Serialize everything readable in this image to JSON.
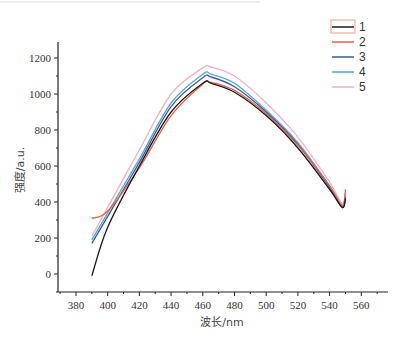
{
  "chart_data": {
    "type": "line",
    "title": "",
    "xlabel": "波长/nm",
    "ylabel": "强度/a.u.",
    "xlim": [
      370,
      570
    ],
    "ylim": [
      -120,
      1300
    ],
    "x_ticks": [
      380,
      400,
      420,
      440,
      460,
      480,
      500,
      520,
      540,
      560
    ],
    "y_ticks": [
      0,
      200,
      400,
      600,
      800,
      1000,
      1200
    ],
    "grid": false,
    "legend_position": "top-right",
    "x": [
      390,
      400,
      420,
      440,
      460,
      465,
      480,
      500,
      520,
      540,
      548,
      550
    ],
    "series": [
      {
        "name": "1",
        "color": "#1a1a1a",
        "values": [
          -10,
          260,
          600,
          900,
          1060,
          1060,
          1010,
          880,
          700,
          470,
          370,
          420
        ]
      },
      {
        "name": "2",
        "color": "#e8604c",
        "values": [
          310,
          350,
          590,
          880,
          1055,
          1065,
          1020,
          890,
          715,
          490,
          380,
          470
        ]
      },
      {
        "name": "3",
        "color": "#3b5a9a",
        "values": [
          170,
          320,
          620,
          930,
          1090,
          1095,
          1040,
          900,
          720,
          480,
          370,
          430
        ]
      },
      {
        "name": "4",
        "color": "#5aa6cf",
        "values": [
          190,
          340,
          640,
          950,
          1110,
          1110,
          1060,
          910,
          730,
          490,
          380,
          440
        ]
      },
      {
        "name": "5",
        "color": "#f1b2c2",
        "values": [
          210,
          370,
          690,
          1000,
          1145,
          1150,
          1100,
          950,
          760,
          510,
          390,
          450
        ]
      }
    ]
  },
  "legend": {
    "items": [
      {
        "label": "1",
        "color": "#1a1a1a"
      },
      {
        "label": "2",
        "color": "#e8604c"
      },
      {
        "label": "3",
        "color": "#3b5a9a"
      },
      {
        "label": "4",
        "color": "#5aa6cf"
      },
      {
        "label": "5",
        "color": "#f1b2c2"
      }
    ]
  },
  "axes": {
    "xlabel": "波长/nm",
    "ylabel": "强度/a.u."
  }
}
